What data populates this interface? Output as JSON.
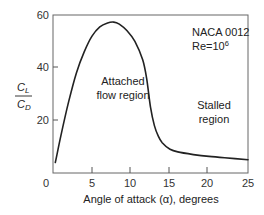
{
  "chart_data": {
    "type": "line",
    "title": "",
    "xlabel": "Angle of attack (α), degrees",
    "ylabel": "CL/CD",
    "ylabel_numerator": "C",
    "ylabel_numerator_sub": "L",
    "ylabel_denominator": "C",
    "ylabel_denominator_sub": "D",
    "xlim": [
      0,
      25
    ],
    "ylim": [
      0,
      60
    ],
    "x_ticks": [
      0,
      5,
      10,
      15,
      20,
      25
    ],
    "y_ticks": [
      20,
      40,
      60
    ],
    "x_tick_labels": [
      "0",
      "5",
      "10",
      "15",
      "20",
      "25"
    ],
    "y_tick_labels": [
      "20",
      "40",
      "60"
    ],
    "grid": false,
    "legend": null,
    "series": [
      {
        "name": "NACA 0012, Re=10^6",
        "x": [
          0.3,
          1,
          2,
          3,
          4,
          5,
          6,
          7,
          7.8,
          8.5,
          9.5,
          10.5,
          11.5,
          12,
          12.5,
          13,
          13.5,
          14,
          15,
          16,
          18,
          20,
          22,
          25
        ],
        "y": [
          4,
          14,
          27,
          38,
          46,
          52,
          55.5,
          57,
          57.3,
          56.5,
          54,
          50,
          43,
          36,
          25,
          18,
          14,
          11.5,
          9,
          8,
          7,
          6.3,
          5.8,
          5
        ]
      }
    ],
    "annotations": [
      {
        "text": "NACA 0012",
        "x": 15,
        "y": 53
      },
      {
        "text": "Re=10",
        "superscript": "6",
        "x": 15,
        "y": 47
      },
      {
        "text": "Attached",
        "x": 9.5,
        "y": 33
      },
      {
        "text": "flow region",
        "x": 9.5,
        "y": 27
      },
      {
        "text": "Stalled",
        "x": 20.5,
        "y": 27
      },
      {
        "text": "region",
        "x": 20.5,
        "y": 21
      }
    ]
  },
  "labels": {
    "annot_airfoil": "NACA 0012",
    "annot_re": "Re=10",
    "annot_re_sup": "6",
    "annot_attached_1": "Attached",
    "annot_attached_2": "flow region",
    "annot_stalled_1": "Stalled",
    "annot_stalled_2": "region",
    "x_axis_label": "Angle of attack (α), degrees",
    "x_tick_0": "0",
    "x_tick_5": "5",
    "x_tick_10": "10",
    "x_tick_15": "15",
    "x_tick_20": "20",
    "x_tick_25": "25",
    "y_tick_20": "20",
    "y_tick_40": "40",
    "y_tick_60": "60",
    "y_num_main": "C",
    "y_num_sub": "L",
    "y_den_main": "C",
    "y_den_sub": "D"
  },
  "colors": {
    "line": "#222222",
    "axis": "#555555",
    "text": "#222222"
  }
}
